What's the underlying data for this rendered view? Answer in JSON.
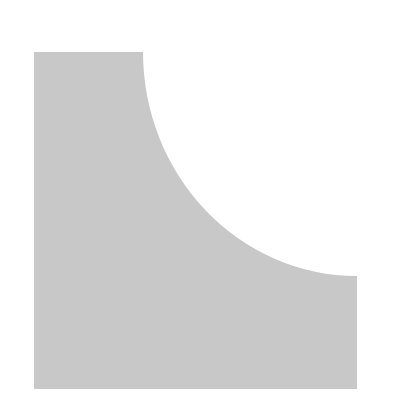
{
  "shape": {
    "kind": "square-with-concave-quarter-circle-cutout",
    "fill": "#c8c8c8",
    "background": "#ffffff",
    "bounds": {
      "x": 34,
      "y": 52,
      "width": 323,
      "height": 337
    },
    "arc": {
      "start": [
        143,
        52
      ],
      "end": [
        357,
        276
      ],
      "center": [
        357,
        52
      ],
      "rx": 214,
      "ry": 224
    }
  }
}
